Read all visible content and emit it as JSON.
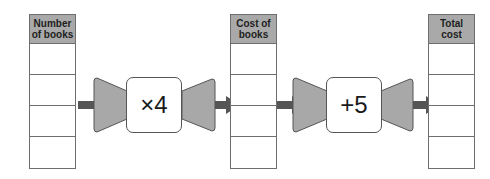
{
  "columns": [
    {
      "id": "number-of-books",
      "header": "Number of books",
      "header_lines": [
        "Number",
        "of books"
      ],
      "rows": [
        "",
        "",
        "",
        ""
      ]
    },
    {
      "id": "cost-of-books",
      "header": "Cost of books",
      "header_lines": [
        "Cost of",
        "books"
      ],
      "rows": [
        "",
        "",
        "",
        ""
      ]
    },
    {
      "id": "total-cost",
      "header": "Total cost",
      "header_lines": [
        "Total",
        "cost"
      ],
      "rows": [
        "",
        "",
        "",
        ""
      ]
    }
  ],
  "operations": [
    {
      "id": "multiply",
      "label": "×4"
    },
    {
      "id": "add",
      "label": "+5"
    }
  ],
  "colors": {
    "header_fill": "#a9a9a9",
    "funnel_fill": "#a8a8a8",
    "arrow_fill": "#555555",
    "outline": "#6e6e6e"
  }
}
